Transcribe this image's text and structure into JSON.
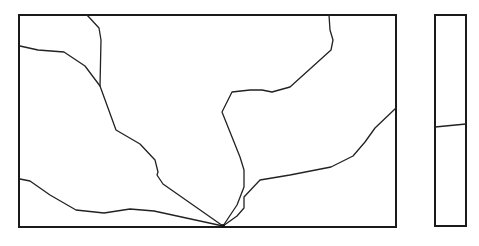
{
  "diagram": {
    "canvas": {
      "width": 479,
      "height": 246,
      "background": "#ffffff"
    },
    "colors": {
      "frame": "#1a1a1a",
      "line": "#222222"
    },
    "main_frame": {
      "x": 19,
      "y": 15,
      "width": 377,
      "height": 212
    },
    "side_panel": {
      "x": 435,
      "y": 15,
      "width": 31,
      "height": 211
    },
    "convergence_point": {
      "x": 223,
      "y": 226
    },
    "paths": [
      {
        "name": "left-upper-boundary",
        "points": "20,46 38,50 64,52 85,66 100,86 116,130 140,144 155,160 158,172 157,175 163,184 223,226"
      },
      {
        "name": "top-left-branch",
        "points": "87,15 99,28 101,40 100,86"
      },
      {
        "name": "left-lower-boundary",
        "points": "20,179 30,181 50,195 76,210 104,213 130,209 154,211 223,226"
      },
      {
        "name": "center-boundary",
        "points": "223,226 237,205 244,187 244,170 240,157 222,112 232,92 250,90 262,90 272,92 290,87 331,50 333,40 330,30 329,15"
      },
      {
        "name": "right-boundary",
        "points": "223,226 237,216 244,208 244,197 260,180 290,175 331,167 353,156 365,142 375,128 396,108"
      },
      {
        "name": "side-panel-divider",
        "points": "435,127 466,124"
      }
    ]
  }
}
